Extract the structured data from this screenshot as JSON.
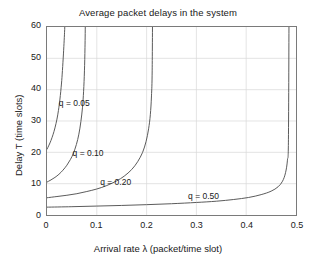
{
  "chart_data": {
    "type": "line",
    "title": "Average packet delays in the system",
    "xlabel": "Arrival rate λ (packet/time slot)",
    "ylabel": "Delay T (time slots)",
    "xlim": [
      0,
      0.5
    ],
    "ylim": [
      0,
      60
    ],
    "xticks": [
      "0",
      "0.1",
      "0.2",
      "0.3",
      "0.4",
      "0.5"
    ],
    "xtick_values": [
      0,
      0.1,
      0.2,
      0.3,
      0.4,
      0.5
    ],
    "yticks": [
      "0",
      "10",
      "20",
      "30",
      "40",
      "50",
      "60"
    ],
    "ytick_values": [
      0,
      10,
      20,
      30,
      40,
      50,
      60
    ],
    "grid": true,
    "legend_position": "inline-annotations",
    "line_color": "#595959",
    "axis_color": "#7a7a7a",
    "grid_color": "#d8d8d8",
    "background": "#ffffff",
    "series": [
      {
        "name": "q = 0.05",
        "label": "q = 0.05",
        "y_intercept": 21,
        "asymptote_x": 0.0385,
        "label_x": 0.0255,
        "label_y": 35.5,
        "x": [
          0,
          0.004,
          0.008,
          0.012,
          0.016,
          0.02,
          0.023,
          0.026,
          0.029,
          0.031,
          0.033,
          0.0345,
          0.0355,
          0.0365,
          0.0372,
          0.0378,
          0.0382
        ],
        "y": [
          21.0,
          22.3,
          23.8,
          25.6,
          27.8,
          30.6,
          33.4,
          37.0,
          41.8,
          46.1,
          51.4,
          55.8,
          59.2,
          63.5,
          67.5,
          71.8,
          75.5
        ]
      },
      {
        "name": "q = 0.10",
        "label": "q = 0.10",
        "y_intercept": 10.5,
        "asymptote_x": 0.077,
        "label_x": 0.053,
        "label_y": 19.5,
        "x": [
          0,
          0.008,
          0.016,
          0.024,
          0.032,
          0.04,
          0.047,
          0.053,
          0.059,
          0.064,
          0.068,
          0.0712,
          0.0735,
          0.0752,
          0.0763,
          0.077
        ],
        "y": [
          10.5,
          11.2,
          12.0,
          13.0,
          14.3,
          15.9,
          17.7,
          19.7,
          22.5,
          25.8,
          29.8,
          34.2,
          39.5,
          46.0,
          53.5,
          62.0
        ]
      },
      {
        "name": "q = 0.20",
        "label": "q = 0.20",
        "y_intercept": 5.5,
        "asymptote_x": 0.212,
        "label_x": 0.108,
        "label_y": 10.3,
        "x": [
          0,
          0.02,
          0.04,
          0.06,
          0.08,
          0.1,
          0.12,
          0.14,
          0.155,
          0.17,
          0.182,
          0.192,
          0.199,
          0.204,
          0.2075,
          0.2098,
          0.2112
        ],
        "y": [
          5.5,
          5.9,
          6.3,
          6.8,
          7.5,
          8.3,
          9.4,
          10.9,
          12.4,
          14.5,
          17.0,
          20.0,
          23.5,
          27.5,
          32.0,
          38.0,
          46.0
        ]
      },
      {
        "name": "q = 0.50",
        "label": "q = 0.50",
        "y_intercept": 2.5,
        "asymptote_x": 0.486,
        "label_x": 0.283,
        "label_y": 6.0,
        "x": [
          0,
          0.05,
          0.1,
          0.15,
          0.2,
          0.25,
          0.3,
          0.34,
          0.375,
          0.405,
          0.43,
          0.45,
          0.464,
          0.473,
          0.479,
          0.4828,
          0.4848
        ],
        "y": [
          2.5,
          2.65,
          2.85,
          3.05,
          3.3,
          3.6,
          4.0,
          4.4,
          4.95,
          5.6,
          6.5,
          7.6,
          9.0,
          10.8,
          13.5,
          17.5,
          24.0
        ]
      }
    ]
  }
}
